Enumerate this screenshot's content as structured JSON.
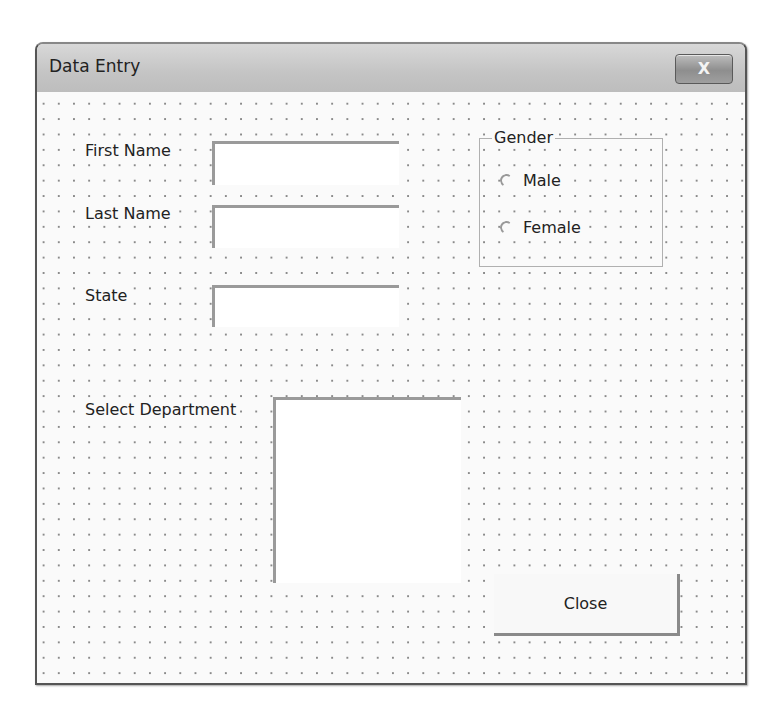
{
  "window": {
    "title": "Data Entry",
    "close_glyph": "X"
  },
  "form": {
    "first_name": {
      "label": "First Name",
      "value": ""
    },
    "last_name": {
      "label": "Last Name",
      "value": ""
    },
    "state": {
      "label": "State",
      "value": ""
    },
    "gender": {
      "caption": "Gender",
      "options": [
        {
          "label": "Male",
          "selected": false
        },
        {
          "label": "Female",
          "selected": false
        }
      ]
    },
    "department": {
      "label": "Select Department",
      "items": []
    },
    "close_button": {
      "label": "Close"
    }
  }
}
